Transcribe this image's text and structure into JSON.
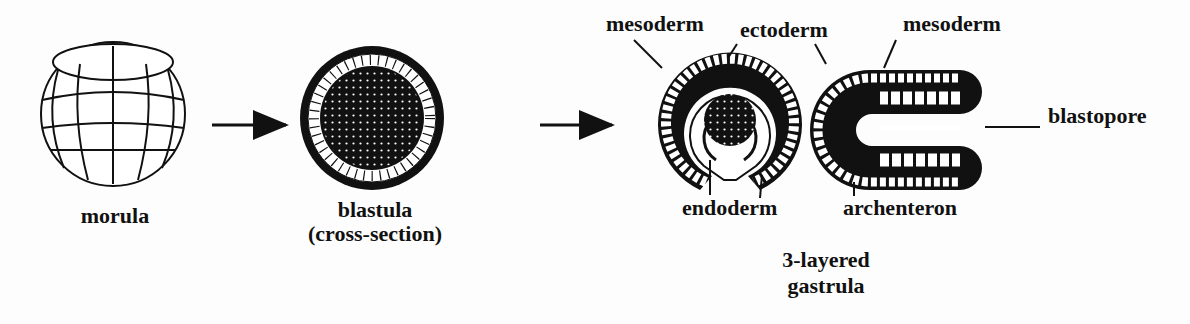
{
  "stages": {
    "morula": {
      "label": "morula"
    },
    "blastula": {
      "label": "blastula",
      "sublabel": "(cross-section)"
    },
    "gastrula": {
      "label_line1": "3-layered",
      "label_line2": "gastrula"
    }
  },
  "labels": {
    "mesoderm_left": "mesoderm",
    "ectoderm": "ectoderm",
    "mesoderm_right": "mesoderm",
    "blastopore": "blastopore",
    "endoderm": "endoderm",
    "archenteron": "archenteron"
  },
  "colors": {
    "ink": "#111111",
    "background": "#fdfdfd"
  }
}
